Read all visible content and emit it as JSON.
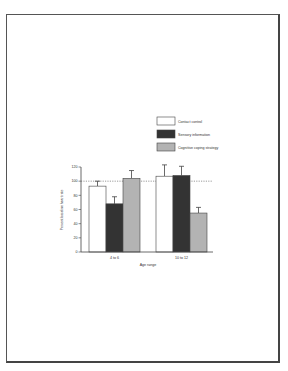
{
  "chart_data": {
    "type": "bar",
    "title": "",
    "xlabel": "Age range",
    "ylabel": "Percent baseline heart rate",
    "ylim": [
      0,
      120
    ],
    "yticks": [
      0,
      20,
      40,
      60,
      80,
      100,
      120
    ],
    "reference_line": 100,
    "categories": [
      "4 to 6",
      "10 to 12"
    ],
    "series": [
      {
        "name": "Contact control",
        "color": "#ffffff",
        "values": [
          93,
          107
        ],
        "error_upper": [
          100,
          123
        ]
      },
      {
        "name": "Sensory information",
        "color": "#333333",
        "values": [
          68,
          108
        ],
        "error_upper": [
          78,
          121
        ]
      },
      {
        "name": "Cognitive coping strategy",
        "color": "#b3b3b3",
        "values": [
          104,
          55
        ],
        "error_upper": [
          115,
          63
        ]
      }
    ],
    "legend_position": "upper right"
  }
}
